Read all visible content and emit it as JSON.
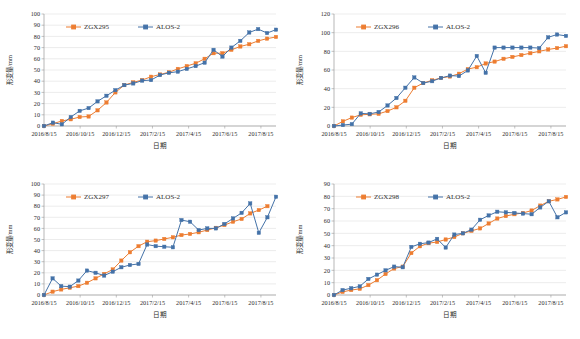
{
  "figure": {
    "panel_count": 4,
    "shared": {
      "xlabel": "日期",
      "ylabel": "形变量/mm",
      "xticks": [
        "2016/8/15",
        "2016/10/15",
        "2016/12/15",
        "2017/2/15",
        "2017/4/15",
        "2017/6/15",
        "2017/8/15"
      ],
      "colors": {
        "zgx": "#ED7D31",
        "alos": "#4472A8",
        "grid": "#d9d9d9",
        "axis": "#9a9a9a",
        "text": "#2b2b2b"
      }
    }
  },
  "chart_data": [
    {
      "type": "line",
      "panel": "top-left",
      "title": "",
      "xlabel": "日期",
      "ylabel": "形变量/mm",
      "ylim": [
        0,
        100
      ],
      "yticks": [
        0,
        10,
        20,
        30,
        40,
        50,
        60,
        70,
        80,
        90,
        100
      ],
      "grid": true,
      "legend_position": "top-center",
      "x": [
        "2016/8/15",
        "2016/9/1",
        "2016/9/15",
        "2016/10/1",
        "2016/10/15",
        "2016/11/1",
        "2016/11/15",
        "2016/12/1",
        "2016/12/15",
        "2017/1/1",
        "2017/1/15",
        "2017/2/1",
        "2017/2/15",
        "2017/3/1",
        "2017/3/15",
        "2017/4/1",
        "2017/4/15",
        "2017/5/1",
        "2017/5/15",
        "2017/6/1",
        "2017/6/15",
        "2017/7/1",
        "2017/7/15",
        "2017/8/1",
        "2017/8/15",
        "2017/9/1",
        "2017/9/15"
      ],
      "series": [
        {
          "name": "ZGX295",
          "color": "#ED7D31",
          "values": [
            0,
            2,
            4.5,
            6,
            8,
            8.5,
            14,
            21,
            30,
            36.5,
            39,
            41,
            44,
            46,
            48,
            51,
            53.5,
            56,
            60,
            65,
            65,
            68,
            71,
            73,
            76,
            78,
            79.5
          ]
        },
        {
          "name": "ALOS-2",
          "color": "#4472A8",
          "values": [
            0,
            3,
            1.5,
            8,
            13.5,
            16,
            22,
            27,
            32,
            36.5,
            38,
            40.5,
            41,
            45.5,
            47.5,
            48.5,
            51,
            53.5,
            56.5,
            68,
            62,
            70,
            76,
            83.5,
            86.5,
            83,
            86
          ]
        }
      ]
    },
    {
      "type": "line",
      "panel": "top-right",
      "title": "",
      "xlabel": "日期",
      "ylabel": "形变量/mm",
      "ylim": [
        0,
        120
      ],
      "yticks": [
        0,
        20,
        40,
        60,
        80,
        100,
        120
      ],
      "grid": true,
      "legend_position": "top-center",
      "x": [
        "2016/8/15",
        "2016/9/1",
        "2016/9/15",
        "2016/10/1",
        "2016/10/15",
        "2016/11/1",
        "2016/11/15",
        "2016/12/1",
        "2016/12/15",
        "2017/1/1",
        "2017/1/15",
        "2017/2/1",
        "2017/2/15",
        "2017/3/1",
        "2017/3/15",
        "2017/4/1",
        "2017/4/15",
        "2017/5/1",
        "2017/5/15",
        "2017/6/1",
        "2017/6/15",
        "2017/7/1",
        "2017/7/15",
        "2017/8/1",
        "2017/8/15",
        "2017/9/1",
        "2017/9/15"
      ],
      "series": [
        {
          "name": "ZGX296",
          "color": "#ED7D31",
          "values": [
            0,
            5,
            9,
            12,
            12.5,
            13,
            16,
            20,
            27,
            41,
            46,
            49,
            51.5,
            53,
            56,
            61,
            63,
            67,
            69,
            72,
            74,
            76,
            78,
            80,
            82,
            83.5,
            85.5
          ]
        },
        {
          "name": "ALOS-2",
          "color": "#4472A8",
          "values": [
            0,
            1,
            2,
            13.5,
            13,
            15,
            22,
            30,
            41,
            52,
            46,
            48,
            51.5,
            54,
            53.5,
            59.5,
            75,
            57,
            84,
            84,
            84,
            84,
            84,
            83.5,
            95,
            98,
            96.5
          ]
        }
      ]
    },
    {
      "type": "line",
      "panel": "bottom-left",
      "title": "",
      "xlabel": "日期",
      "ylabel": "形变量/mm",
      "ylim": [
        0,
        100
      ],
      "yticks": [
        0,
        10,
        20,
        30,
        40,
        50,
        60,
        70,
        80,
        90,
        100
      ],
      "grid": true,
      "legend_position": "top-center",
      "x": [
        "2016/8/15",
        "2016/9/1",
        "2016/9/15",
        "2016/10/1",
        "2016/10/15",
        "2016/11/1",
        "2016/11/15",
        "2016/12/1",
        "2016/12/15",
        "2017/1/1",
        "2017/1/15",
        "2017/2/1",
        "2017/2/15",
        "2017/3/1",
        "2017/3/15",
        "2017/4/1",
        "2017/4/15",
        "2017/5/1",
        "2017/5/15",
        "2017/6/1",
        "2017/6/15",
        "2017/7/1",
        "2017/7/15",
        "2017/8/1",
        "2017/8/15",
        "2017/9/1",
        "2017/9/15"
      ],
      "series": [
        {
          "name": "ZGX297",
          "color": "#ED7D31",
          "values": [
            0,
            3,
            5,
            6.5,
            8,
            11,
            15,
            19,
            23,
            31,
            38.5,
            44,
            48,
            49,
            50.5,
            52,
            54,
            55,
            56.5,
            58.5,
            60.5,
            63,
            66,
            68.5,
            73.5,
            76.5,
            80
          ]
        },
        {
          "name": "ALOS-2",
          "color": "#4472A8",
          "values": [
            0,
            15,
            8,
            7.5,
            13,
            22,
            20,
            17.5,
            21,
            25,
            27,
            28,
            45.5,
            44,
            43.5,
            43,
            67.5,
            66,
            58.5,
            60,
            60,
            64,
            69,
            74,
            82.5,
            56,
            70,
            88.5
          ]
        }
      ]
    },
    {
      "type": "line",
      "panel": "bottom-right",
      "title": "",
      "xlabel": "日期",
      "ylabel": "形变量/mm",
      "ylim": [
        0,
        90
      ],
      "yticks": [
        0,
        10,
        20,
        30,
        40,
        50,
        60,
        70,
        80,
        90
      ],
      "grid": true,
      "legend_position": "top-center",
      "x": [
        "2016/8/15",
        "2016/9/1",
        "2016/9/15",
        "2016/10/1",
        "2016/10/15",
        "2016/11/1",
        "2016/11/15",
        "2016/12/1",
        "2016/12/15",
        "2017/1/1",
        "2017/1/15",
        "2017/2/1",
        "2017/2/15",
        "2017/3/1",
        "2017/3/15",
        "2017/4/1",
        "2017/4/15",
        "2017/5/1",
        "2017/5/15",
        "2017/6/1",
        "2017/6/15",
        "2017/7/1",
        "2017/7/15",
        "2017/8/1",
        "2017/8/15",
        "2017/9/1",
        "2017/9/15"
      ],
      "series": [
        {
          "name": "ZGX298",
          "color": "#ED7D31",
          "values": [
            0,
            2.5,
            4,
            5,
            8,
            12,
            17,
            21.5,
            23,
            34,
            39.5,
            42,
            43,
            45,
            47,
            50,
            52,
            54,
            58,
            62,
            64,
            65.5,
            66.5,
            68.5,
            72.5,
            76,
            77.5,
            79.5
          ]
        },
        {
          "name": "ALOS-2",
          "color": "#4472A8",
          "values": [
            0,
            4,
            5.5,
            7,
            13,
            16.5,
            20,
            23,
            22.5,
            39,
            41.5,
            42.5,
            45.5,
            38.5,
            49,
            50,
            53,
            61,
            64.5,
            67.5,
            67,
            66.5,
            66,
            65.5,
            71,
            76,
            63,
            67
          ]
        }
      ]
    }
  ],
  "legends": [
    {
      "items": [
        {
          "label": "ZGX295",
          "color": "#ED7D31"
        },
        {
          "label": "ALOS-2",
          "color": "#4472A8"
        }
      ]
    },
    {
      "items": [
        {
          "label": "ZGX296",
          "color": "#ED7D31"
        },
        {
          "label": "ALOS-2",
          "color": "#4472A8"
        }
      ]
    },
    {
      "items": [
        {
          "label": "ZGX297",
          "color": "#ED7D31"
        },
        {
          "label": "ALOS-2",
          "color": "#4472A8"
        }
      ]
    },
    {
      "items": [
        {
          "label": "ZGX298",
          "color": "#ED7D31"
        },
        {
          "label": "ALOS-2",
          "color": "#4472A8"
        }
      ]
    }
  ]
}
